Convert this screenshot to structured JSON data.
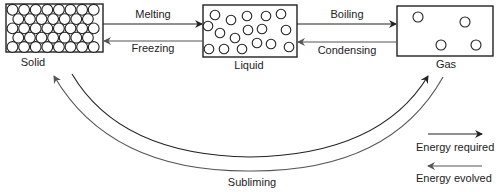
{
  "states": {
    "solid": {
      "label": "Solid"
    },
    "liquid": {
      "label": "Liquid"
    },
    "gas": {
      "label": "Gas"
    }
  },
  "transitions": {
    "melting": "Melting",
    "freezing": "Freezing",
    "boiling": "Boiling",
    "condensing": "Condensing",
    "subliming": "Subliming"
  },
  "legend": {
    "energy_required": "Energy required",
    "energy_evolved": "Energy evolved"
  }
}
